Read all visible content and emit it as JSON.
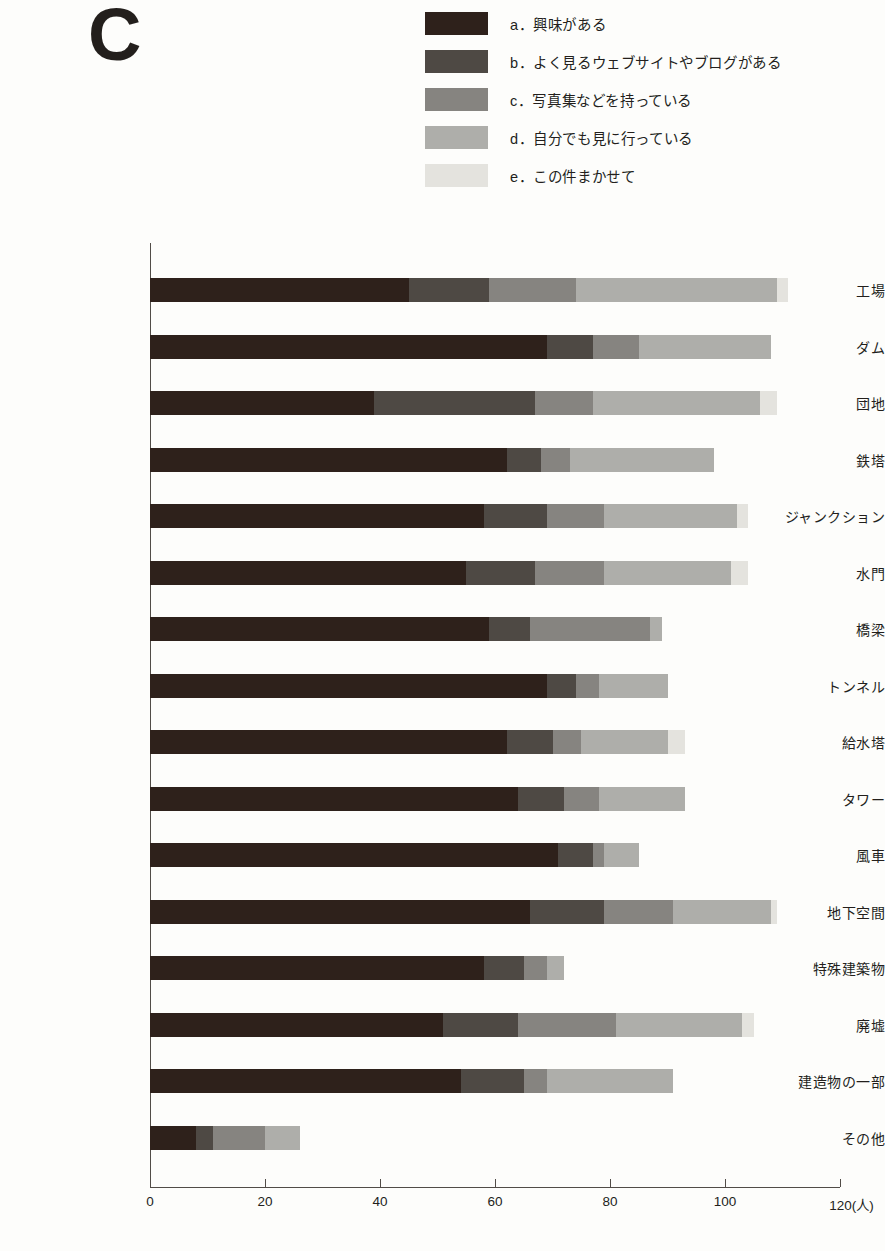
{
  "panel": {
    "letter": "C"
  },
  "legend": {
    "items": [
      {
        "key": "a",
        "label": "a．興味がある",
        "color": "#2e211b"
      },
      {
        "key": "b",
        "label": "b．よく見るウェブサイトやブログがある",
        "color": "#4e4944"
      },
      {
        "key": "c",
        "label": "c．写真集などを持っている",
        "color": "#868480"
      },
      {
        "key": "d",
        "label": "d．自分でも見に行っている",
        "color": "#aeaeaa"
      },
      {
        "key": "e",
        "label": "e．この件まかせて",
        "color": "#e4e3de"
      }
    ]
  },
  "axis": {
    "x_unit_label": "120(人)",
    "x_ticks": [
      {
        "value": 0,
        "label": "0"
      },
      {
        "value": 20,
        "label": "20"
      },
      {
        "value": 40,
        "label": "40"
      },
      {
        "value": 60,
        "label": "60"
      },
      {
        "value": 80,
        "label": "80"
      },
      {
        "value": 100,
        "label": "100"
      },
      {
        "value": 120,
        "label": "120(人)"
      }
    ]
  },
  "chart_data": {
    "type": "bar",
    "orientation": "horizontal",
    "stacked": true,
    "title": "C",
    "xlabel": "120(人)",
    "ylabel": "",
    "xlim": [
      0,
      120
    ],
    "grid": false,
    "legend_position": "top-right",
    "categories": [
      "工場",
      "ダム",
      "団地",
      "鉄塔",
      "ジャンクション",
      "水門",
      "橋梁",
      "トンネル",
      "給水塔",
      "タワー",
      "風車",
      "地下空間",
      "特殊建築物",
      "廃墟",
      "建造物の一部",
      "その他"
    ],
    "series": [
      {
        "name": "a．興味がある",
        "color": "#2e211b",
        "values": [
          45,
          69,
          39,
          62,
          58,
          55,
          59,
          69,
          62,
          64,
          71,
          66,
          58,
          51,
          54,
          8
        ]
      },
      {
        "name": "b．よく見るウェブサイトやブログがある",
        "color": "#4e4944",
        "values": [
          14,
          8,
          28,
          6,
          11,
          12,
          7,
          5,
          8,
          8,
          6,
          13,
          7,
          13,
          11,
          3
        ]
      },
      {
        "name": "c．写真集などを持っている",
        "color": "#868480",
        "values": [
          15,
          8,
          10,
          5,
          10,
          12,
          21,
          4,
          5,
          6,
          2,
          12,
          4,
          17,
          4,
          9
        ]
      },
      {
        "name": "d．自分でも見に行っている",
        "color": "#aeaeaa",
        "values": [
          35,
          23,
          29,
          25,
          23,
          22,
          2,
          12,
          15,
          15,
          6,
          17,
          3,
          22,
          22,
          6
        ]
      },
      {
        "name": "e．この件まかせて",
        "color": "#e4e3de",
        "values": [
          2,
          0,
          3,
          0,
          2,
          3,
          0,
          0,
          3,
          0,
          0,
          1,
          0,
          2,
          0,
          0
        ]
      }
    ],
    "totals": [
      111,
      108,
      109,
      98,
      104,
      104,
      89,
      90,
      93,
      93,
      85,
      109,
      72,
      105,
      91,
      26
    ]
  },
  "layout": {
    "plot_left_px": 150,
    "plot_right_px": 840,
    "bar_top_px": 278,
    "bar_pitch_px": 56.5,
    "bar_height_px": 24
  }
}
